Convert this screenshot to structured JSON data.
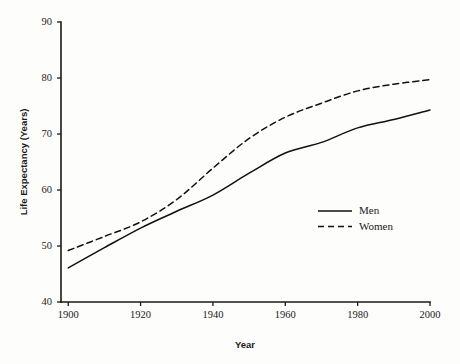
{
  "chart_data": {
    "type": "line",
    "title": "",
    "xlabel": "Year",
    "ylabel": "Life Expectancy (Years)",
    "xlim": [
      1898,
      2000
    ],
    "ylim": [
      40,
      90
    ],
    "xticks": [
      1900,
      1920,
      1940,
      1960,
      1980,
      2000
    ],
    "xtick_labels": [
      "1900",
      "1920",
      "1940",
      "1960",
      "1980",
      "2000"
    ],
    "yticks": [
      40,
      50,
      60,
      70,
      80,
      90
    ],
    "ytick_labels": [
      "40",
      "50",
      "60",
      "70",
      "80",
      "90"
    ],
    "grid": false,
    "legend_position": "center-right-inside",
    "x": [
      1900,
      1910,
      1920,
      1930,
      1940,
      1950,
      1960,
      1970,
      1980,
      1990,
      2000
    ],
    "series": [
      {
        "name": "Men",
        "style": "solid",
        "color": "#111111",
        "values": [
          46.1,
          49.7,
          53.2,
          56.2,
          59.1,
          63.0,
          66.6,
          68.5,
          71.1,
          72.6,
          74.3
        ]
      },
      {
        "name": "Women",
        "style": "dashed",
        "color": "#111111",
        "values": [
          49.2,
          51.7,
          54.3,
          58.3,
          63.9,
          69.2,
          73.0,
          75.5,
          77.7,
          78.9,
          79.7
        ]
      }
    ]
  },
  "legend": {
    "entries": [
      {
        "label": "Men",
        "style": "solid"
      },
      {
        "label": "Women",
        "style": "dashed"
      }
    ]
  }
}
